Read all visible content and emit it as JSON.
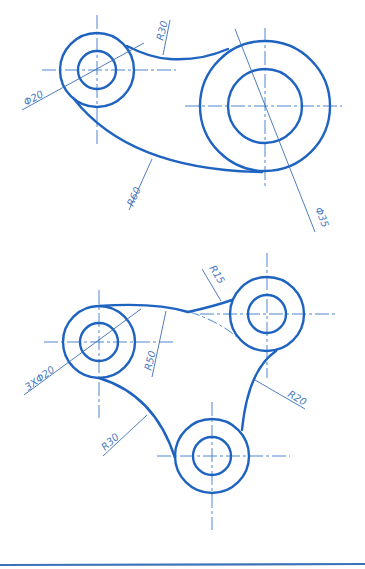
{
  "figure_1": {
    "name": "Link plate with two bosses",
    "dimensions": {
      "small_hole": "Φ20",
      "top_fillet": "R30",
      "bottom_arc": "R60",
      "large_hole": "Φ35"
    }
  },
  "figure_2": {
    "name": "Three-boss plate",
    "dimensions": {
      "holes": "3XΦ20",
      "top_arc": "R50",
      "top_fillet": "R15",
      "right_arc": "R20",
      "left_arc": "R30"
    }
  },
  "colors": {
    "outline": "#1f63c0",
    "centerline": "#3a78c9",
    "dimension": "#3a6fb5",
    "label": "#4a7cc0",
    "background": "#ffffff"
  }
}
